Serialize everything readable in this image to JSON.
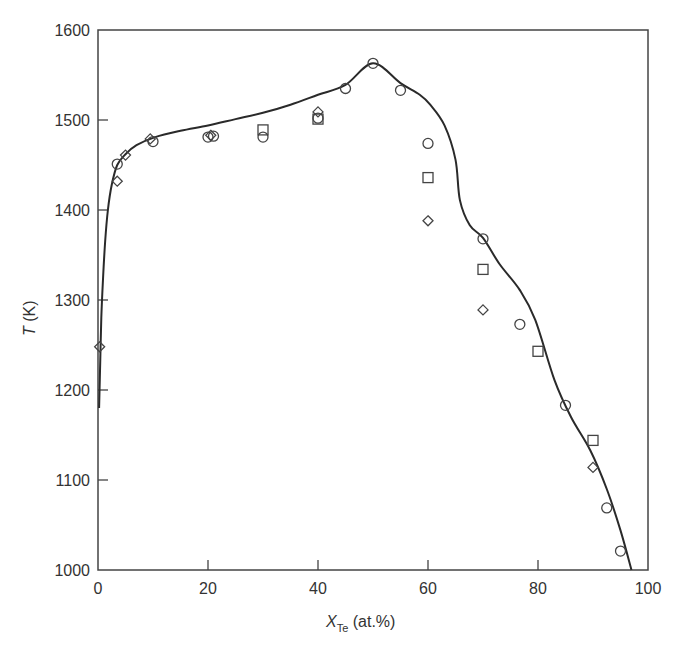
{
  "chart_data": {
    "type": "scatter",
    "title": "",
    "xlabel": {
      "main": "X",
      "subscript": "Te",
      "suffix": " (at.%)"
    },
    "ylabel": {
      "main": "T",
      "suffix": " (K)"
    },
    "xlim": [
      0,
      100
    ],
    "ylim": [
      1000,
      1600
    ],
    "xticks": [
      0,
      20,
      40,
      60,
      80,
      100
    ],
    "yticks": [
      1000,
      1100,
      1200,
      1300,
      1400,
      1500,
      1600
    ],
    "xtick_labels": [
      "0",
      "20",
      "40",
      "60",
      "80",
      "100"
    ],
    "ytick_labels": [
      "1000",
      "1100",
      "1200",
      "1300",
      "1400",
      "1500",
      "1600"
    ],
    "grid": false,
    "legend": null,
    "series": [
      {
        "name": "calculated liquidus",
        "kind": "line",
        "x": [
          0.2,
          0.4,
          0.6,
          0.9,
          1.3,
          1.8,
          2.5,
          3.5,
          5,
          7,
          10.4,
          15,
          20,
          25,
          30,
          35,
          40,
          45,
          50,
          55,
          58.5,
          60.4,
          63,
          65,
          65.8,
          67.6,
          70,
          73,
          76.7,
          79.5,
          83,
          86,
          89.5,
          92.5,
          95,
          97
        ],
        "y": [
          1180,
          1230,
          1280,
          1322,
          1365,
          1400,
          1428,
          1450,
          1462,
          1472,
          1481,
          1488,
          1494,
          1501,
          1508,
          1517,
          1528,
          1539,
          1563,
          1541,
          1528,
          1517,
          1494,
          1456,
          1411,
          1383,
          1369,
          1340,
          1311,
          1278,
          1211,
          1170,
          1133,
          1090,
          1044,
          1000
        ]
      },
      {
        "name": "circles",
        "kind": "circle",
        "x": [
          3.5,
          10,
          20,
          21,
          30,
          40,
          45,
          50,
          55,
          60,
          70,
          76.7,
          85,
          92.5,
          95
        ],
        "y": [
          1451,
          1476,
          1481,
          1482,
          1481,
          1502,
          1535,
          1563,
          1533,
          1474,
          1368,
          1273,
          1183,
          1069,
          1021
        ]
      },
      {
        "name": "squares",
        "kind": "square",
        "x": [
          30,
          40,
          60,
          70,
          80,
          90
        ],
        "y": [
          1489,
          1501,
          1436,
          1334,
          1243,
          1144
        ]
      },
      {
        "name": "diamonds",
        "kind": "diamond",
        "x": [
          0.3,
          3.5,
          5,
          9.5,
          20.5,
          40,
          60,
          70,
          90
        ],
        "y": [
          1248,
          1432,
          1461,
          1479,
          1483,
          1509,
          1388,
          1289,
          1114
        ]
      }
    ]
  }
}
